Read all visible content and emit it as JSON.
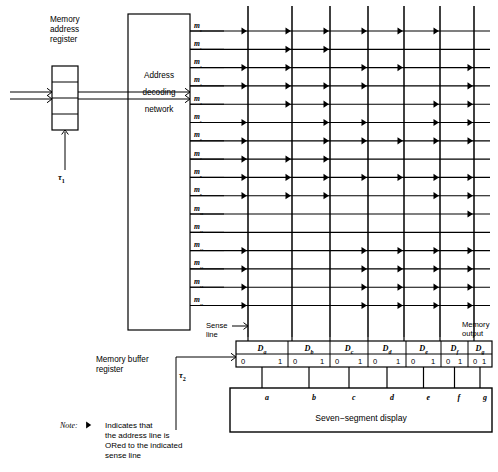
{
  "figure": {
    "note": {
      "label": "Note:",
      "marker_icon": "right-triangle-icon",
      "lines": [
        "Indicates that",
        "the address line is",
        "ORed to the indicated",
        "sense line"
      ]
    }
  },
  "memory_address_register": {
    "label_lines": [
      "Memory",
      "address",
      "register"
    ],
    "cells": 4,
    "clock_label": "τ₁"
  },
  "address_decoding_network": {
    "label_lines": [
      "Address",
      "decoding",
      "network"
    ]
  },
  "memory_buffer_register": {
    "label_lines": [
      "Memory buffer",
      "register"
    ],
    "clock_label": "τ₂",
    "cells": [
      {
        "name": "Dₐ",
        "sub": "a",
        "zero": "0",
        "one": "1"
      },
      {
        "name": "Dᵇ",
        "sub": "b",
        "zero": "0",
        "one": "1"
      },
      {
        "name": "Dᶜ",
        "sub": "c",
        "zero": "0",
        "one": "1"
      },
      {
        "name": "Dᵈ",
        "sub": "d",
        "zero": "0",
        "one": "1"
      },
      {
        "name": "Dᵉ",
        "sub": "e",
        "zero": "0",
        "one": "1"
      },
      {
        "name": "Dᶠ",
        "sub": "f",
        "zero": "0",
        "one": "1"
      },
      {
        "name": "Dᵍ",
        "sub": "g",
        "zero": "0",
        "one": "1"
      }
    ]
  },
  "seven_segment_display": {
    "label": "Seven−segment display",
    "segment_labels": [
      "a",
      "b",
      "c",
      "d",
      "e",
      "f",
      "g"
    ]
  },
  "annotations": {
    "sense_line": [
      "Sense",
      "line"
    ],
    "memory_output": [
      "Memory",
      "output"
    ]
  },
  "word_lines": [
    "m₀",
    "m₁",
    "m₂",
    "m₃",
    "m₄",
    "m₅",
    "m₆",
    "m₇",
    "m₈",
    "m₉",
    "m₁₀",
    "m₁₁",
    "m₁₂",
    "m₁₃",
    "m₁₄",
    "m₁₅"
  ],
  "sense_lines": [
    "a",
    "b",
    "c",
    "d",
    "e",
    "f",
    "g"
  ],
  "chart_data": {
    "type": "table",
    "xlabel": "Sense line (segment)",
    "ylabel": "Address line (word line)",
    "categories": [
      "a",
      "b",
      "c",
      "d",
      "e",
      "f",
      "g"
    ],
    "rows": [
      "m0",
      "m1",
      "m2",
      "m3",
      "m4",
      "m5",
      "m6",
      "m7",
      "m8",
      "m9",
      "m10",
      "m11",
      "m12",
      "m13",
      "m14",
      "m15"
    ],
    "legend": "1 = diode present (address line ORed to sense line)",
    "matrix": [
      [
        1,
        1,
        1,
        1,
        1,
        1,
        0
      ],
      [
        0,
        1,
        1,
        0,
        0,
        0,
        0
      ],
      [
        1,
        1,
        0,
        1,
        1,
        0,
        1
      ],
      [
        1,
        1,
        1,
        1,
        0,
        0,
        1
      ],
      [
        0,
        1,
        1,
        0,
        0,
        1,
        1
      ],
      [
        1,
        0,
        1,
        1,
        0,
        1,
        1
      ],
      [
        1,
        0,
        1,
        1,
        1,
        1,
        1
      ],
      [
        1,
        1,
        1,
        0,
        0,
        0,
        0
      ],
      [
        1,
        1,
        1,
        1,
        1,
        1,
        1
      ],
      [
        1,
        1,
        1,
        0,
        0,
        1,
        1
      ],
      [
        0,
        0,
        0,
        0,
        0,
        0,
        1
      ],
      [
        0,
        0,
        0,
        0,
        0,
        0,
        0
      ],
      [
        1,
        0,
        0,
        1,
        1,
        1,
        1
      ],
      [
        1,
        0,
        0,
        1,
        1,
        1,
        1
      ],
      [
        1,
        0,
        0,
        1,
        1,
        1,
        1
      ],
      [
        1,
        0,
        0,
        1,
        1,
        1,
        1
      ]
    ]
  },
  "colors": {
    "line": "#000000",
    "background": "#ffffff"
  }
}
